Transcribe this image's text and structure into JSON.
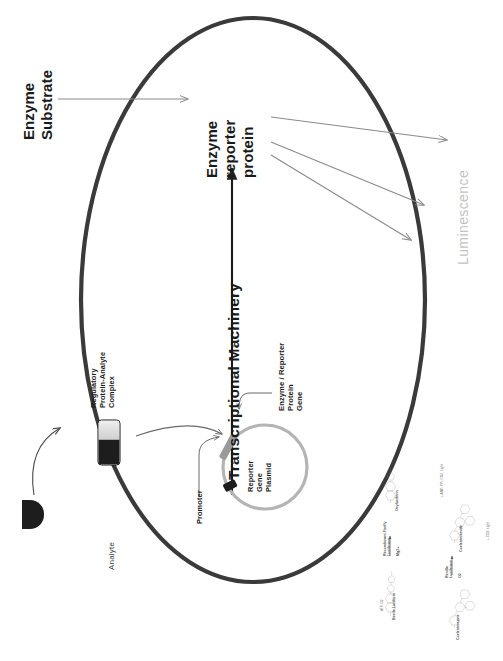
{
  "figure": {
    "orientation": "labels rotated 90 degrees counter-clockwise"
  },
  "labels": {
    "enzyme_substrate_line1": "Enzyme",
    "enzyme_substrate_line2": "Substrate",
    "enzyme_reporter_line1": "Enzyme",
    "enzyme_reporter_line2": "reporter",
    "enzyme_reporter_line3": "protein",
    "transcriptional_machinery": "Transcriptional Machinery",
    "luminescence": "Luminescence",
    "analyte": "Analyte",
    "promoter": "Promoter",
    "regulatory_complex_line1": "Regulatory",
    "regulatory_complex_line2": "Protein-Analyte",
    "regulatory_complex_line3": "Complex",
    "gene_line1": "Enzyme / Reporter",
    "gene_line2": "Protein",
    "gene_line3": "Gene",
    "plasmid_line1": "Reporter",
    "plasmid_line2": "Gene",
    "plasmid_line3": "Plasmid"
  },
  "chemistry": {
    "reaction_firefly": {
      "substrate": "Beetle Luciferin",
      "enzyme_line1": "Recombinant Firefly",
      "enzyme_line2": "Luciferase",
      "cofactor": "Mg2+",
      "substrate_note": "ATP, O2",
      "product": "Oxyluciferin",
      "product_note": "+ AMP, PPi, CO2, Light"
    },
    "reaction_renilla": {
      "substrate": "Coelenterazine",
      "enzyme_line1": "Renilla",
      "enzyme_line2": "Luciferase",
      "cofactor": "O2",
      "product": "Coelenteramide",
      "product_note": "+ CO2, Light"
    }
  },
  "colors": {
    "cell_membrane": "#3a3a3a",
    "arrow_gray": "#8a8a8a",
    "arrow_dark": "#4a4a4a",
    "promoter_block": "#1d1d1d",
    "gene_block": "#9a9a9a",
    "plasmid_ring": "#b4b4b4",
    "luminescence_text": "#c3c3c3",
    "text": "#1a1a1a"
  }
}
